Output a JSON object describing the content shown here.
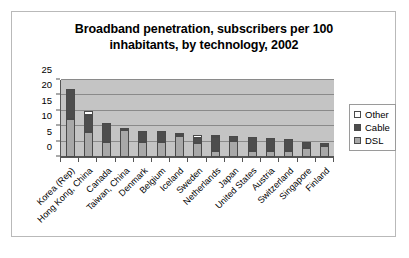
{
  "chart_data": {
    "type": "bar",
    "stacked": true,
    "title": "Broadband penetration, subscribers per 100 inhabitants, by technology, 2002",
    "title_lines": [
      "Broadband penetration, subscribers per 100",
      "inhabitants, by technology, 2002"
    ],
    "xlabel": "",
    "ylabel": "",
    "ylim": [
      0,
      25
    ],
    "ytick_values": [
      0,
      5,
      10,
      15,
      20,
      25
    ],
    "ytick_labels": [
      "0",
      "5",
      "10",
      "15",
      "20",
      "25"
    ],
    "grid": true,
    "legend_position": "right",
    "categories": [
      "Korea (Rep)",
      "Hong Kong, China",
      "Canada",
      "Taiwan, China",
      "Denmark",
      "Belgium",
      "Iceland",
      "Sweden",
      "Netherlands",
      "Japan",
      "United States",
      "Austria",
      "Switzerland",
      "Singapore",
      "Finland"
    ],
    "series": [
      {
        "name": "DSL",
        "color": "#a8a8a8",
        "values": [
          12.4,
          8.1,
          5.0,
          8.7,
          4.9,
          5.0,
          6.7,
          4.7,
          1.9,
          5.2,
          1.8,
          1.8,
          1.8,
          2.9,
          3.6
        ]
      },
      {
        "name": "Cable",
        "color": "#4d4d4d",
        "values": [
          9.8,
          5.4,
          6.0,
          0.6,
          3.5,
          3.4,
          0.4,
          1.6,
          4.7,
          1.5,
          4.6,
          4.4,
          3.9,
          2.1,
          1.0
        ]
      },
      {
        "name": "Other",
        "color": "#ffffff",
        "values": [
          0.0,
          1.4,
          0.0,
          0.0,
          0.0,
          0.0,
          0.8,
          0.9,
          0.2,
          0.0,
          0.0,
          0.0,
          0.0,
          0.0,
          0.0
        ]
      }
    ],
    "totals": [
      22.2,
      14.9,
      11.0,
      9.3,
      8.4,
      8.4,
      7.9,
      7.2,
      6.8,
      6.7,
      6.4,
      6.2,
      5.7,
      5.0,
      4.6
    ]
  },
  "legend": {
    "items": [
      {
        "label": "Other",
        "color": "#ffffff"
      },
      {
        "label": "Cable",
        "color": "#4d4d4d"
      },
      {
        "label": "DSL",
        "color": "#a8a8a8"
      }
    ]
  }
}
